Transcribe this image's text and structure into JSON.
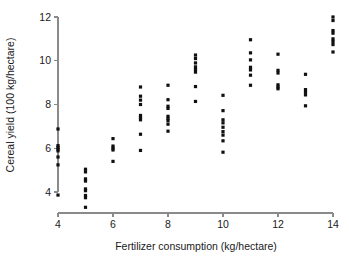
{
  "chart_data": {
    "type": "scatter",
    "title": "",
    "xlabel": "Fertilizer consumption (kg/hectare)",
    "ylabel": "Cereal yield (100 kg/hectare)",
    "xlim": [
      3.3,
      14.6
    ],
    "ylim": [
      3.0,
      12.3
    ],
    "xticks": [
      4,
      6,
      8,
      10,
      12,
      14
    ],
    "xtick_labels": [
      "4",
      "6",
      "8",
      "10",
      "12",
      "14"
    ],
    "yticks": [
      4,
      6,
      8,
      10,
      12
    ],
    "ytick_labels": [
      "4",
      "6",
      "8",
      "10",
      "12"
    ],
    "grid": false,
    "legend": "none",
    "marker": "square",
    "marker_color": "#101010",
    "marker_size": 3.2,
    "points": [
      {
        "x": 4,
        "y": 6.88
      },
      {
        "x": 4,
        "y": 6.12
      },
      {
        "x": 4,
        "y": 6.04
      },
      {
        "x": 4,
        "y": 5.96
      },
      {
        "x": 4,
        "y": 5.88
      },
      {
        "x": 4,
        "y": 5.6
      },
      {
        "x": 4,
        "y": 5.24
      },
      {
        "x": 4,
        "y": 3.86
      },
      {
        "x": 5,
        "y": 5.04
      },
      {
        "x": 5,
        "y": 4.92
      },
      {
        "x": 5,
        "y": 4.6
      },
      {
        "x": 5,
        "y": 4.5
      },
      {
        "x": 5,
        "y": 4.14
      },
      {
        "x": 5,
        "y": 4.06
      },
      {
        "x": 5,
        "y": 3.84
      },
      {
        "x": 5,
        "y": 3.74
      },
      {
        "x": 5,
        "y": 3.3
      },
      {
        "x": 6,
        "y": 6.44
      },
      {
        "x": 6,
        "y": 6.1
      },
      {
        "x": 6,
        "y": 6.0
      },
      {
        "x": 6,
        "y": 5.92
      },
      {
        "x": 6,
        "y": 5.4
      },
      {
        "x": 7,
        "y": 8.8
      },
      {
        "x": 7,
        "y": 8.38
      },
      {
        "x": 7,
        "y": 8.2
      },
      {
        "x": 7,
        "y": 8.0
      },
      {
        "x": 7,
        "y": 7.5
      },
      {
        "x": 7,
        "y": 7.4
      },
      {
        "x": 7,
        "y": 7.3
      },
      {
        "x": 7,
        "y": 6.64
      },
      {
        "x": 7,
        "y": 5.9
      },
      {
        "x": 8,
        "y": 8.88
      },
      {
        "x": 8,
        "y": 8.22
      },
      {
        "x": 8,
        "y": 7.92
      },
      {
        "x": 8,
        "y": 7.82
      },
      {
        "x": 8,
        "y": 7.46
      },
      {
        "x": 8,
        "y": 7.36
      },
      {
        "x": 8,
        "y": 7.26
      },
      {
        "x": 8,
        "y": 7.1
      },
      {
        "x": 8,
        "y": 6.78
      },
      {
        "x": 9,
        "y": 10.26
      },
      {
        "x": 9,
        "y": 10.1
      },
      {
        "x": 9,
        "y": 9.9
      },
      {
        "x": 9,
        "y": 9.72
      },
      {
        "x": 9,
        "y": 9.6
      },
      {
        "x": 9,
        "y": 9.48
      },
      {
        "x": 9,
        "y": 8.82
      },
      {
        "x": 9,
        "y": 8.14
      },
      {
        "x": 10,
        "y": 8.42
      },
      {
        "x": 10,
        "y": 7.72
      },
      {
        "x": 10,
        "y": 7.3
      },
      {
        "x": 10,
        "y": 7.16
      },
      {
        "x": 10,
        "y": 6.96
      },
      {
        "x": 10,
        "y": 6.76
      },
      {
        "x": 10,
        "y": 6.6
      },
      {
        "x": 10,
        "y": 6.34
      },
      {
        "x": 10,
        "y": 5.82
      },
      {
        "x": 11,
        "y": 10.96
      },
      {
        "x": 11,
        "y": 10.36
      },
      {
        "x": 11,
        "y": 10.04
      },
      {
        "x": 11,
        "y": 9.7
      },
      {
        "x": 11,
        "y": 9.58
      },
      {
        "x": 11,
        "y": 9.34
      },
      {
        "x": 11,
        "y": 8.88
      },
      {
        "x": 12,
        "y": 10.3
      },
      {
        "x": 12,
        "y": 9.56
      },
      {
        "x": 12,
        "y": 9.44
      },
      {
        "x": 12,
        "y": 8.9
      },
      {
        "x": 12,
        "y": 8.8
      },
      {
        "x": 12,
        "y": 8.72
      },
      {
        "x": 13,
        "y": 9.38
      },
      {
        "x": 13,
        "y": 8.68
      },
      {
        "x": 13,
        "y": 8.56
      },
      {
        "x": 13,
        "y": 8.44
      },
      {
        "x": 13,
        "y": 7.94
      },
      {
        "x": 14,
        "y": 12.0
      },
      {
        "x": 14,
        "y": 11.84
      },
      {
        "x": 14,
        "y": 11.38
      },
      {
        "x": 14,
        "y": 11.26
      },
      {
        "x": 14,
        "y": 11.0
      },
      {
        "x": 14,
        "y": 10.88
      },
      {
        "x": 14,
        "y": 10.74
      },
      {
        "x": 14,
        "y": 10.4
      }
    ]
  }
}
